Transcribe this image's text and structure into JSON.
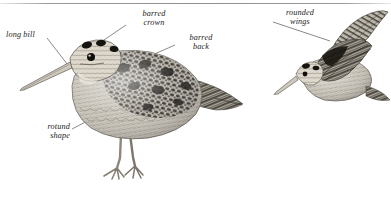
{
  "plate": {
    "title": "American Woodcock identification plate",
    "background_color": "#ffffff",
    "rule_color": "#8f8f8f",
    "ink_color": "#1b1b1b",
    "leader_color": "#3a3a3a"
  },
  "labels": {
    "long_bill": "long bill",
    "barred_crown_line1": "barred",
    "barred_crown_line2": "crown",
    "barred_back_line1": "barred",
    "barred_back_line2": "back",
    "rotund_shape_line1": "rotund",
    "rotund_shape_line2": "shape",
    "rounded_wings_line1": "rounded",
    "rounded_wings_line2": "wings"
  },
  "figures": {
    "standing_bird": "woodcock-standing-left-facing",
    "flying_bird": "woodcock-in-flight"
  }
}
